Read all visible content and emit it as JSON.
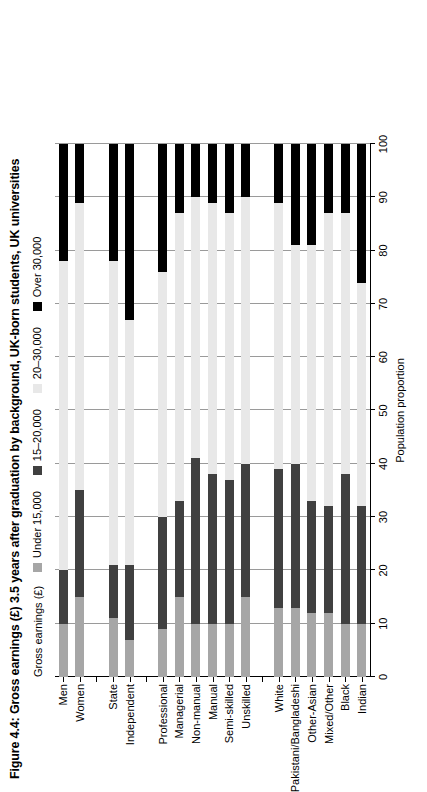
{
  "figure": {
    "title": "Figure 4.4: Gross earnings (£) 3.5 years after graduation by background, UK-born students, UK universities"
  },
  "legend": {
    "title": "Gross earnings (£)",
    "items": [
      {
        "label": "Under 15,000",
        "color": "#a6a6a6"
      },
      {
        "label": "15–20,000",
        "color": "#404040"
      },
      {
        "label": "20–30,000",
        "color": "#e8e8e8"
      },
      {
        "label": "Over 30,000",
        "color": "#000000"
      }
    ]
  },
  "axis": {
    "x_title": "Population proportion",
    "x_ticks": [
      0,
      10,
      20,
      30,
      40,
      50,
      60,
      70,
      80,
      90,
      100
    ],
    "x_min": 0,
    "x_max": 100,
    "grid": true
  },
  "chart_data": {
    "type": "bar",
    "orientation": "horizontal",
    "stacked": true,
    "title": "Figure 4.4: Gross earnings (£) 3.5 years after graduation by background, UK-born students, UK universities",
    "xlabel": "Population proportion",
    "ylabel": "",
    "xlim": [
      0,
      100
    ],
    "categories": [
      "Men",
      "Women",
      "",
      "State",
      "Independent",
      "",
      "Professional",
      "Managerial",
      "Non-manual",
      "Manual",
      "Semi-skilled",
      "Unskilled",
      "",
      "White",
      "Pakistani/Bangladeshi",
      "Other-Asian",
      "Mixed/Other",
      "Black",
      "Indian"
    ],
    "series": [
      {
        "name": "Under 15,000",
        "color": "#a6a6a6",
        "values": [
          10,
          15,
          null,
          11,
          7,
          null,
          9,
          15,
          10,
          10,
          10,
          15,
          null,
          13,
          13,
          12,
          12,
          10,
          10
        ]
      },
      {
        "name": "15–20,000",
        "color": "#404040",
        "values": [
          10,
          20,
          null,
          10,
          14,
          null,
          21,
          18,
          31,
          28,
          27,
          25,
          null,
          26,
          27,
          21,
          20,
          28,
          22
        ]
      },
      {
        "name": "20–30,000",
        "color": "#e8e8e8",
        "values": [
          58,
          54,
          null,
          57,
          46,
          null,
          46,
          54,
          49,
          51,
          50,
          50,
          null,
          50,
          41,
          48,
          55,
          49,
          42
        ]
      },
      {
        "name": "Over 30,000",
        "color": "#000000",
        "values": [
          22,
          11,
          null,
          22,
          33,
          null,
          24,
          13,
          10,
          11,
          13,
          10,
          null,
          11,
          19,
          19,
          13,
          13,
          26
        ]
      }
    ]
  }
}
